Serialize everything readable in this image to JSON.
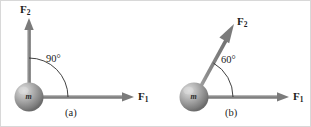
{
  "figure": {
    "background_color": "#ffffff",
    "border_color": "#d8d8d8",
    "stroke_color": "#808080",
    "text_color": "#1c1c1c",
    "sphere_colors": {
      "highlight": "#d4d4d4",
      "mid": "#9a9a9a",
      "edge": "#6e6e6e"
    }
  },
  "panels": [
    {
      "id": "a",
      "caption": "(a)",
      "mass_label": "m",
      "angle": {
        "value": "90°",
        "degrees": 90
      },
      "vectors": [
        {
          "name": "F1",
          "label_base": "F",
          "label_sub": "1",
          "direction_deg": 0
        },
        {
          "name": "F2",
          "label_base": "F",
          "label_sub": "2",
          "direction_deg": 90
        }
      ]
    },
    {
      "id": "b",
      "caption": "(b)",
      "mass_label": "m",
      "angle": {
        "value": "60°",
        "degrees": 60
      },
      "vectors": [
        {
          "name": "F1",
          "label_base": "F",
          "label_sub": "1",
          "direction_deg": 0
        },
        {
          "name": "F2",
          "label_base": "F",
          "label_sub": "2",
          "direction_deg": 60
        }
      ]
    }
  ]
}
